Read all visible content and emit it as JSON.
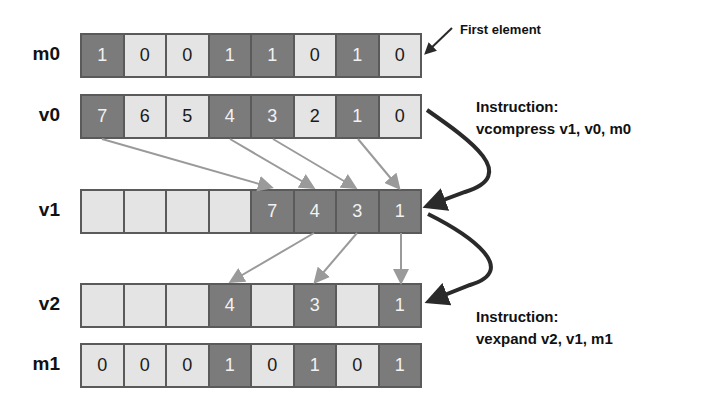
{
  "rows": [
    {
      "label": "m0",
      "top": 33,
      "cells": [
        "1",
        "0",
        "0",
        "1",
        "1",
        "0",
        "1",
        "0"
      ],
      "dark": [
        1,
        0,
        0,
        1,
        1,
        0,
        1,
        0
      ]
    },
    {
      "label": "v0",
      "top": 94,
      "cells": [
        "7",
        "6",
        "5",
        "4",
        "3",
        "2",
        "1",
        "0"
      ],
      "dark": [
        1,
        0,
        0,
        1,
        1,
        0,
        1,
        0
      ]
    },
    {
      "label": "v1",
      "top": 189,
      "cells": [
        "",
        "",
        "",
        "",
        "7",
        "4",
        "3",
        "1"
      ],
      "dark": [
        0,
        0,
        0,
        0,
        1,
        1,
        1,
        1
      ]
    },
    {
      "label": "v2",
      "top": 283,
      "cells": [
        "",
        "",
        "",
        "4",
        "",
        "3",
        "",
        "1"
      ],
      "dark": [
        0,
        0,
        0,
        1,
        0,
        1,
        0,
        1
      ]
    },
    {
      "label": "m1",
      "top": 343,
      "cells": [
        "0",
        "0",
        "0",
        "1",
        "0",
        "1",
        "0",
        "1"
      ],
      "dark": [
        0,
        0,
        0,
        1,
        0,
        1,
        0,
        1
      ]
    }
  ],
  "annotations": {
    "first_element": "First element",
    "compress_title": "Instruction:",
    "compress_cmd": "vcompress v1, v0, m0",
    "expand_title": "Instruction:",
    "expand_cmd": "vexpand v2, v1, m1"
  },
  "colors": {
    "dark_cell": "#7b7b7b",
    "light_cell": "#e4e4e4",
    "border": "#5a5a5a",
    "thin_arrow": "#9a9a9a",
    "thick_arrow": "#2a2a2a"
  }
}
